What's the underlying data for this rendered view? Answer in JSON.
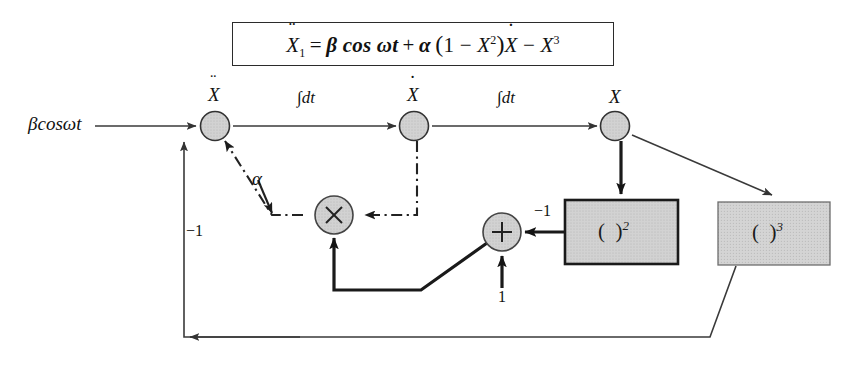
{
  "figure": {
    "type": "analog-computer block diagram",
    "equation_box": {
      "lhs": "Ẍ₁",
      "rhs": "β cos ωt + α (1 − X²) Ẋ − X³",
      "full_text": "Ẍ1 = β cos ωt + α (1 − X²) Ẋ − X³",
      "parts": {
        "X": "X",
        "sub1": "1",
        "eq": "=",
        "beta": "β",
        "cos": "cos",
        "omega": "ω",
        "t": "t",
        "plus": "+",
        "alpha": "α",
        "lparen": "(",
        "one": "1",
        "minus": "−",
        "X2": "X",
        "exp2": "2",
        "rparen": ")",
        "Xdot": "X",
        "minus2": "−",
        "X3": "X",
        "exp3": "3"
      }
    },
    "input_label": "βcosωt",
    "node_labels": {
      "node1": "Ẍ",
      "node2": "Ẋ",
      "node3": "X"
    },
    "integrator_labels": [
      "∫dt",
      "∫dt"
    ],
    "gain_labels": {
      "alpha": "α",
      "minus_one_left": "−1",
      "minus_one_square": "−1",
      "unity": "1"
    },
    "operators": {
      "multiply": "×",
      "add": "+"
    },
    "blocks": [
      {
        "name": "square-block",
        "label_open": "(",
        "label_close": ")",
        "exponent": "2"
      },
      {
        "name": "cube-block",
        "label_open": "(",
        "label_close": ")",
        "exponent": "3"
      }
    ],
    "caption": "",
    "colors": {
      "node_fill": "#cccccc",
      "block_fill": "#cfcfcf",
      "line": "#3a3a3a",
      "heavy_line": "#1a1a1a",
      "border": "#2b2b2b",
      "background": "#ffffff"
    }
  }
}
